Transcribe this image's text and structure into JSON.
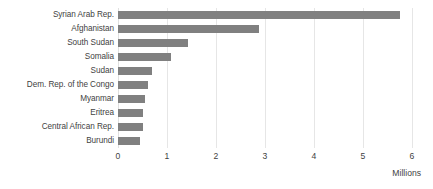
{
  "chart_data": {
    "type": "bar",
    "orientation": "horizontal",
    "title": "",
    "subtitle": "",
    "xlabel": "Millions",
    "ylabel": "",
    "xlim": [
      0,
      6
    ],
    "xticks": [
      "0",
      "1",
      "2",
      "3",
      "4",
      "5",
      "6"
    ],
    "grid": "vertical",
    "legend": "none",
    "categories": [
      "Syrian Arab Rep.",
      "Afghanistan",
      "South Sudan",
      "Somalia",
      "Sudan",
      "Dem. Rep. of the Congo",
      "Myanmar",
      "Eritrea",
      "Central African Rep.",
      "Burundi"
    ],
    "values": [
      5.75,
      2.88,
      1.43,
      1.08,
      0.7,
      0.62,
      0.56,
      0.52,
      0.51,
      0.44
    ],
    "series": [
      {
        "name": "Refugees",
        "values": [
          5.75,
          2.88,
          1.43,
          1.08,
          0.7,
          0.62,
          0.56,
          0.52,
          0.51,
          0.44
        ]
      }
    ],
    "colors": {
      "bar": "#808080",
      "gridline": "#e6e6e6",
      "text": "#3f3f3f",
      "background": "#ffffff"
    }
  }
}
